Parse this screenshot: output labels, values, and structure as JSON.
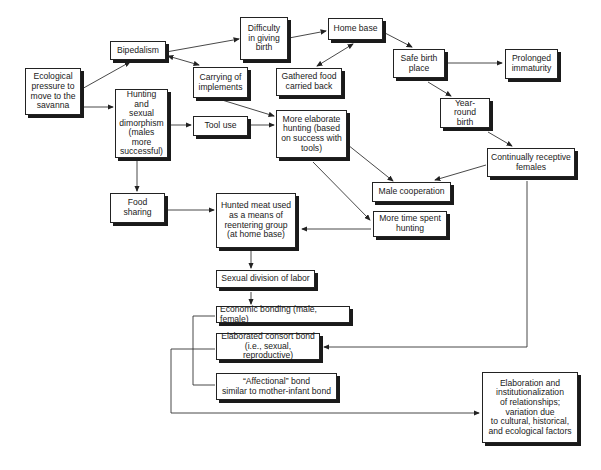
{
  "diagram": {
    "nodes": {
      "ecological": "Ecological\npressure to\nmove to the\nsavanna",
      "bipedalism": "Bipedalism",
      "difficulty": "Difficulty\nin giving\nbirth",
      "home_base": "Home base",
      "carrying": "Carrying of\nimplements",
      "gathered": "Gathered food\ncarried back",
      "safe_birth": "Safe birth\nplace",
      "prolonged": "Prolonged\nimmaturity",
      "hunting_dimorphism": "Hunting\nand\nsexual\ndimorphism\n(males more\nsuccessful)",
      "tool_use": "Tool use",
      "elaborate_hunting": "More elaborate\nhunting (based\non success with\ntools)",
      "year_round": "Year-round\nbirth",
      "receptive": "Continually receptive\nfemales",
      "male_coop": "Male cooperation",
      "food_sharing": "Food\nsharing",
      "hunted_meat": "Hunted meat used\nas a means of\nreentering group\n(at home base)",
      "more_time": "More time spent\nhunting",
      "division_labor": "Sexual division of labor",
      "economic": "Economic bonding (male, female)",
      "consort": "Elaborated consort bond\n(i.e., sexual, reproductive)",
      "affectional": "“Affectional” bond\nsimilar to mother-infant bond",
      "elaboration": "Elaboration and\ninstitutionalization\nof relationships;\nvariation due\nto cultural, historical,\nand ecological factors"
    },
    "edges": [
      [
        "ecological",
        "bipedalism"
      ],
      [
        "ecological",
        "hunting_dimorphism"
      ],
      [
        "bipedalism",
        "difficulty"
      ],
      [
        "bipedalism",
        "carrying",
        "bidirectional"
      ],
      [
        "difficulty",
        "home_base"
      ],
      [
        "home_base",
        "gathered",
        "bidirectional"
      ],
      [
        "home_base",
        "safe_birth"
      ],
      [
        "safe_birth",
        "prolonged"
      ],
      [
        "safe_birth",
        "year_round"
      ],
      [
        "year_round",
        "receptive"
      ],
      [
        "carrying",
        "elaborate_hunting"
      ],
      [
        "hunting_dimorphism",
        "tool_use"
      ],
      [
        "tool_use",
        "elaborate_hunting"
      ],
      [
        "hunting_dimorphism",
        "food_sharing"
      ],
      [
        "elaborate_hunting",
        "male_coop"
      ],
      [
        "elaborate_hunting",
        "more_time"
      ],
      [
        "receptive",
        "male_coop"
      ],
      [
        "receptive",
        "consort"
      ],
      [
        "food_sharing",
        "hunted_meat"
      ],
      [
        "more_time",
        "hunted_meat"
      ],
      [
        "hunted_meat",
        "division_labor"
      ],
      [
        "division_labor",
        "economic"
      ],
      [
        "economic",
        "affectional"
      ],
      [
        "consort",
        "elaboration"
      ]
    ]
  }
}
